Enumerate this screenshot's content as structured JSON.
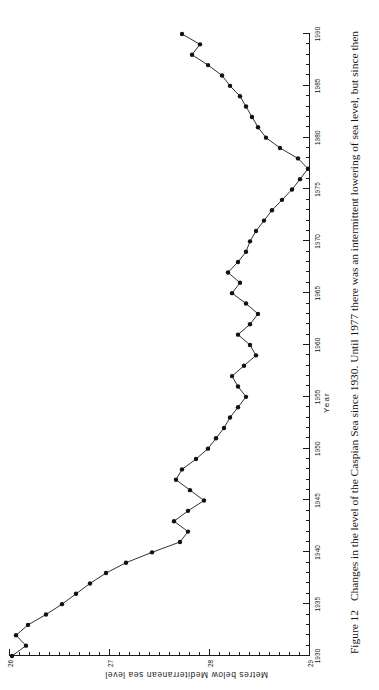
{
  "figure": {
    "number_label": "Figure 12",
    "caption": "Changes in the level of the Caspian Sea since 1930. Until 1977 there was an intermittent lowering of sea level, but since then"
  },
  "axes": {
    "x_title": "Year",
    "y_title": "Metres below Mediterranean sea level",
    "x_ticks": [
      "1930",
      "1935",
      "1940",
      "1945",
      "1950",
      "1955",
      "1960",
      "1965",
      "1970",
      "1975",
      "1980",
      "1985",
      "1990"
    ],
    "y_ticks": [
      "26",
      "27",
      "28",
      "29"
    ]
  },
  "chart_data": {
    "type": "line",
    "title": "Changes in the level of the Caspian Sea since 1930",
    "xlabel": "Year",
    "ylabel": "Metres below Mediterranean sea level",
    "xlim": [
      1930,
      1990
    ],
    "ylim": [
      26.0,
      29.0
    ],
    "y_inverted": false,
    "grid": false,
    "legend": "none",
    "marker": "filled-circle",
    "x": [
      1930,
      1931,
      1932,
      1933,
      1934,
      1935,
      1936,
      1937,
      1938,
      1939,
      1940,
      1941,
      1942,
      1943,
      1944,
      1945,
      1946,
      1947,
      1948,
      1949,
      1950,
      1951,
      1952,
      1953,
      1954,
      1955,
      1956,
      1957,
      1958,
      1959,
      1960,
      1961,
      1962,
      1963,
      1964,
      1965,
      1966,
      1967,
      1968,
      1969,
      1970,
      1971,
      1972,
      1973,
      1974,
      1975,
      1976,
      1977,
      1978,
      1979,
      1980,
      1981,
      1982,
      1983,
      1984,
      1985,
      1986,
      1987,
      1988,
      1989,
      1990
    ],
    "y": [
      26.02,
      26.16,
      26.06,
      26.18,
      26.36,
      26.52,
      26.66,
      26.8,
      26.96,
      27.16,
      27.42,
      27.7,
      27.78,
      27.64,
      27.78,
      27.94,
      27.8,
      27.66,
      27.72,
      27.86,
      27.98,
      28.06,
      28.14,
      28.2,
      28.28,
      28.36,
      28.28,
      28.22,
      28.34,
      28.46,
      28.4,
      28.28,
      28.4,
      28.48,
      28.36,
      28.22,
      28.3,
      28.18,
      28.28,
      28.36,
      28.4,
      28.46,
      28.54,
      28.62,
      28.72,
      28.82,
      28.9,
      28.98,
      28.88,
      28.7,
      28.56,
      28.48,
      28.42,
      28.36,
      28.3,
      28.2,
      28.12,
      27.98,
      27.82,
      27.9,
      27.72
    ],
    "annotations": [
      {
        "label": "lowest level (maximum depth below Mediterranean)",
        "x": 1977,
        "y": 28.98
      }
    ]
  }
}
